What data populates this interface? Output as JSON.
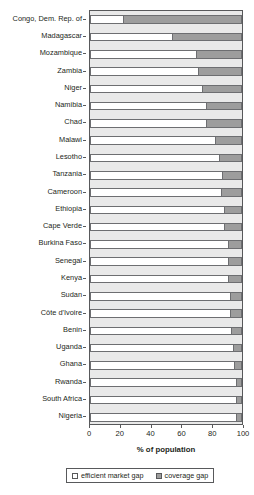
{
  "chart_data": {
    "type": "bar",
    "orientation": "horizontal",
    "stacked": true,
    "title": "",
    "xlabel": "% of population",
    "ylabel": "",
    "xlim": [
      0,
      100
    ],
    "xticks": [
      0,
      20,
      40,
      60,
      80,
      100
    ],
    "xtick_labels": [
      "0",
      "20",
      "40",
      "60",
      "80",
      "100"
    ],
    "grid": false,
    "legend_position": "bottom",
    "categories": [
      "Congo, Dem. Rep. of",
      "Madagascar",
      "Mozambique",
      "Zambia",
      "Niger",
      "Namibia",
      "Chad",
      "Malawi",
      "Lesotho",
      "Tanzania",
      "Cameroon",
      "Ethiopia",
      "Cape Verde",
      "Burkina Faso",
      "Senegal",
      "Kenya",
      "Sudan",
      "Côte d'Ivoire",
      "Benin",
      "Uganda",
      "Ghana",
      "Rwanda",
      "South Africa",
      "Nigeria"
    ],
    "series": [
      {
        "name": "efficient market gap",
        "color": "#ffffff",
        "values": [
          22,
          54,
          70,
          71,
          74,
          76,
          76,
          82,
          85,
          87,
          86,
          88,
          88,
          91,
          91,
          91,
          92,
          92,
          93,
          94,
          95,
          96,
          96,
          96
        ]
      },
      {
        "name": "coverage gap",
        "color": "#9d9d9d",
        "values": [
          78,
          46,
          30,
          29,
          26,
          24,
          24,
          18,
          15,
          13,
          14,
          12,
          12,
          9,
          9,
          9,
          8,
          8,
          7,
          6,
          5,
          4,
          4,
          4
        ]
      }
    ]
  },
  "legend": {
    "items": [
      {
        "label": "efficient market gap",
        "swatch": "efficient"
      },
      {
        "label": "coverage gap",
        "swatch": "coverage"
      }
    ]
  },
  "axis": {
    "x_title": "% of population"
  }
}
